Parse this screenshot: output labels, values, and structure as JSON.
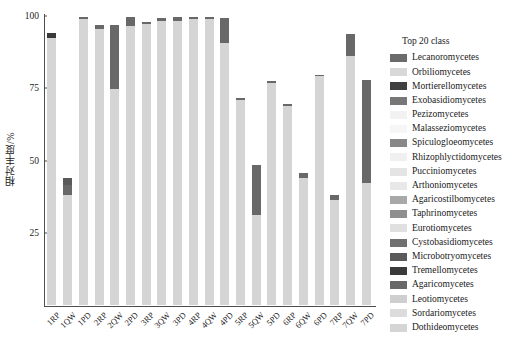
{
  "chart_data": {
    "type": "bar",
    "stacked": true,
    "title": "",
    "xlabel": "",
    "ylabel": "相对丰度/%",
    "ylim": [
      0,
      100
    ],
    "yticks": [
      0,
      25,
      50,
      75,
      100
    ],
    "ytick_labels": [
      "",
      "25",
      "50",
      "75",
      "100"
    ],
    "grid": false,
    "legend_position": "right",
    "legend_title": "Top 20 class",
    "categories": [
      "1RP",
      "1QW",
      "1PD",
      "2RP",
      "2QW",
      "2PD",
      "3RP",
      "3QW",
      "3PD",
      "4RP",
      "4QW",
      "4PD",
      "5RP",
      "5QW",
      "5PD",
      "6RP",
      "6QW",
      "6PD",
      "7RP",
      "7QW",
      "7PD"
    ],
    "series": [
      {
        "name": "Lecanoromycetes",
        "color": "#6b6b6b",
        "values": [
          0,
          0,
          0,
          0,
          0,
          0,
          0,
          0,
          0,
          0,
          0,
          0,
          0,
          0,
          0,
          0,
          0,
          0,
          0,
          0,
          0
        ]
      },
      {
        "name": "Orbiliomycetes",
        "color": "#d8d8d8",
        "values": [
          0,
          0,
          0,
          0,
          0,
          0,
          0,
          0,
          0,
          0,
          0,
          0,
          0,
          0,
          0,
          0,
          0,
          0,
          0,
          0,
          0
        ]
      },
      {
        "name": "Mortierellomycetes",
        "color": "#3f3f3f",
        "values": [
          0,
          0,
          0,
          0,
          0,
          0,
          0,
          0,
          0,
          0,
          0,
          0,
          0,
          0,
          0,
          0,
          0,
          0,
          0,
          0,
          0
        ]
      },
      {
        "name": "Exobasidiomycetes",
        "color": "#777777",
        "values": [
          0,
          0,
          0,
          0,
          0,
          0,
          0,
          0,
          0,
          0,
          0,
          0,
          0,
          0,
          0,
          0,
          0,
          0,
          0,
          0,
          0
        ]
      },
      {
        "name": "Pezizomycetes",
        "color": "#f2f2f2",
        "values": [
          0,
          0,
          0,
          0,
          0,
          0,
          0,
          0,
          0,
          0,
          0,
          0,
          0,
          0,
          0,
          0,
          0,
          0,
          0,
          0,
          0
        ]
      },
      {
        "name": "Malasseziomycetes",
        "color": "#f6f6f6",
        "values": [
          0,
          0,
          0,
          0,
          0,
          0,
          0,
          0,
          0,
          0,
          0,
          0,
          0,
          0,
          0,
          0,
          0,
          0,
          0,
          0,
          0
        ]
      },
      {
        "name": "Spiculogloeomycetes",
        "color": "#888888",
        "values": [
          0,
          0,
          0,
          0,
          0,
          0,
          0,
          0,
          0,
          0,
          0,
          0,
          0,
          0,
          0,
          0,
          0,
          0,
          0,
          0,
          0
        ]
      },
      {
        "name": "Rhizophlyctidomycetes",
        "color": "#f0f0f0",
        "values": [
          0,
          0,
          0,
          0,
          0,
          0,
          0,
          0,
          0,
          0,
          0,
          0,
          0,
          0,
          0,
          0,
          0,
          0,
          0,
          0,
          0
        ]
      },
      {
        "name": "Pucciniomycetes",
        "color": "#e4e4e4",
        "values": [
          0,
          0,
          0,
          0,
          0,
          0,
          0,
          0,
          0,
          0,
          0,
          0,
          0,
          0,
          0,
          0,
          0,
          0,
          0,
          0,
          0
        ]
      },
      {
        "name": "Arthoniomycetes",
        "color": "#e8e8e8",
        "values": [
          0,
          0,
          0,
          0,
          0,
          0,
          0,
          0,
          0,
          0,
          0,
          0,
          0,
          0,
          0,
          0,
          0,
          0,
          0,
          0,
          0
        ]
      },
      {
        "name": "Agaricostilbomycetes",
        "color": "#a8a8a8",
        "values": [
          0,
          0,
          0,
          0,
          0,
          0,
          0,
          0,
          0,
          0,
          0,
          0,
          0,
          0,
          0,
          0,
          0,
          0,
          0,
          0,
          0
        ]
      },
      {
        "name": "Taphrinomycetes",
        "color": "#8f8f8f",
        "values": [
          0,
          0,
          0,
          0,
          0,
          0,
          0,
          0,
          0,
          0,
          0,
          0,
          0,
          0,
          0,
          0,
          0,
          0,
          0,
          0,
          0
        ]
      },
      {
        "name": "Eurotiomycetes",
        "color": "#e0e0e0",
        "values": [
          0,
          0,
          0,
          0,
          0,
          0,
          0,
          0,
          0,
          0,
          0,
          0,
          0,
          0,
          0,
          0,
          0,
          0,
          0,
          0,
          0
        ]
      },
      {
        "name": "Cystobasidiomycetes",
        "color": "#707070",
        "values": [
          0,
          0,
          0,
          0,
          0,
          0,
          0,
          0,
          0,
          0,
          0,
          0,
          0,
          0,
          0,
          0,
          0,
          0,
          0,
          0,
          0
        ]
      },
      {
        "name": "Microbotryomycetes",
        "color": "#5a5a5a",
        "values": [
          0,
          2.5,
          0,
          0,
          0,
          0,
          0,
          0,
          0,
          0,
          0,
          0,
          0,
          0,
          0,
          0,
          0,
          0,
          0,
          0,
          0
        ]
      },
      {
        "name": "Tremellomycetes",
        "color": "#3a3a3a",
        "values": [
          1.5,
          0,
          0,
          0,
          0,
          0,
          0,
          0,
          0,
          0,
          0,
          0,
          0,
          0,
          0,
          0,
          0,
          0,
          0,
          0,
          0
        ]
      },
      {
        "name": "Agaricomycetes",
        "color": "#686868",
        "values": [
          0,
          3.5,
          0.8,
          1.5,
          22.0,
          3.0,
          0.6,
          1.0,
          1.3,
          0.8,
          0.9,
          8.5,
          0.6,
          17.5,
          0.7,
          0.8,
          2.0,
          0.5,
          1.5,
          7.5,
          35.5
        ]
      },
      {
        "name": "Leotiomycetes",
        "color": "#cfcfcf",
        "values": [
          0,
          0,
          0,
          0,
          0,
          0,
          0,
          0,
          0,
          0,
          0,
          0,
          0,
          0,
          0,
          0,
          0,
          0,
          0,
          0,
          0
        ]
      },
      {
        "name": "Sordariomycetes",
        "color": "#dcdcdc",
        "values": [
          0,
          0,
          0,
          0,
          0,
          0,
          0,
          0,
          0,
          0,
          0,
          0,
          0,
          0,
          0,
          0,
          0,
          0,
          0,
          0,
          0
        ]
      },
      {
        "name": "Dothideomycetes",
        "color": "#d5d5d5",
        "values": [
          92.5,
          38.0,
          98.9,
          95.5,
          74.8,
          96.7,
          97.4,
          98.3,
          98.4,
          99.0,
          98.8,
          90.8,
          71.0,
          31.0,
          76.9,
          68.8,
          43.8,
          79.2,
          36.5,
          86.3,
          42.2
        ]
      }
    ],
    "bar_totals": [
      94.0,
      44.0,
      99.7,
      97.0,
      96.8,
      99.7,
      98.0,
      99.3,
      99.7,
      99.8,
      99.7,
      99.3,
      71.6,
      48.5,
      77.6,
      69.6,
      45.8,
      79.7,
      38.0,
      93.8,
      77.7
    ]
  },
  "legend": {
    "title": "Top 20 class"
  },
  "axis": {
    "y_title": "相对丰度/%"
  }
}
